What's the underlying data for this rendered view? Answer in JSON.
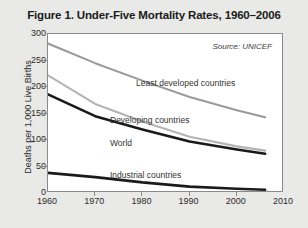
{
  "chart_data": {
    "type": "line",
    "title": "Figure 1. Under-Five Mortality Rates, 1960–2006",
    "xlabel": "",
    "ylabel": "Deaths per 1,000 Live Births",
    "xlim": [
      1960,
      2010
    ],
    "ylim": [
      0,
      300
    ],
    "xticks": [
      1960,
      1970,
      1980,
      1990,
      2000,
      2010
    ],
    "yticks": [
      0,
      50,
      100,
      150,
      200,
      250,
      300
    ],
    "grid": false,
    "legend_position": "inline-labels",
    "annotations": [
      {
        "text": "Source: UNICEF",
        "position": "top-right"
      }
    ],
    "x": [
      1960,
      1970,
      1980,
      1990,
      2000,
      2006
    ],
    "series": [
      {
        "name": "Least developed countries",
        "color": "#9a9a9a",
        "values": [
          282,
          245,
          212,
          181,
          156,
          143
        ]
      },
      {
        "name": "Developing countries",
        "color": "#b4b4b4",
        "values": [
          222,
          168,
          135,
          106,
          88,
          80
        ]
      },
      {
        "name": "World",
        "color": "#1a1a1a",
        "values": [
          186,
          145,
          120,
          97,
          82,
          74
        ]
      },
      {
        "name": "Industrial countries",
        "color": "#1a1a1a",
        "values": [
          38,
          30,
          20,
          12,
          8,
          6
        ]
      }
    ]
  },
  "axis": {
    "ytick_labels": [
      "300",
      "250",
      "200",
      "150",
      "100",
      "50",
      "0"
    ],
    "xtick_labels": [
      "1960",
      "1970",
      "1980",
      "1990",
      "2000",
      "2010"
    ],
    "y_title": "Deaths per 1,000 Live Births"
  },
  "labels": {
    "least_developed": "Least developed countries",
    "developing": "Developing countries",
    "world": "World",
    "industrial": "Industrial countries",
    "source": "Source: UNICEF"
  }
}
